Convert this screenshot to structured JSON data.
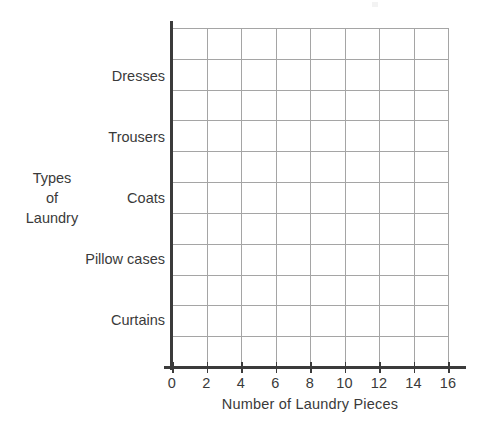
{
  "chart_data": {
    "type": "bar",
    "orientation": "horizontal",
    "title": "",
    "subtitle": "",
    "xlabel": "Number of Laundry Pieces",
    "ylabel": "Types of Laundry",
    "ylabel_lines": [
      "Types",
      "of",
      "Laundry"
    ],
    "categories": [
      "Curtains",
      "Pillow cases",
      "Coats",
      "Trousers",
      "Dresses"
    ],
    "values": [
      null,
      null,
      null,
      null,
      null
    ],
    "series": [
      {
        "name": "Number of Laundry Pieces",
        "values": [
          null,
          null,
          null,
          null,
          null
        ]
      }
    ],
    "xlim": [
      0,
      16
    ],
    "xticks": [
      0,
      2,
      4,
      6,
      8,
      10,
      12,
      14,
      16
    ],
    "xtick_labels": [
      "0",
      "2",
      "4",
      "6",
      "8",
      "10",
      "12",
      "14",
      "16"
    ],
    "x_major_step": 2,
    "grid": true,
    "grid_columns": 8,
    "grid_rows": 11,
    "legend": null,
    "legend_position": "none",
    "annotations": [],
    "note": "Blank worksheet grid: axes and gridlines drawn, no bars plotted yet"
  },
  "axis": {
    "x_title": "Number of Laundry Pieces",
    "y_title_lines": [
      "Types",
      "of",
      "Laundry"
    ],
    "x_tick_labels": [
      "0",
      "2",
      "4",
      "6",
      "8",
      "10",
      "12",
      "14",
      "16"
    ],
    "category_labels": [
      "Dresses",
      "Trousers",
      "Coats",
      "Pillow cases",
      "Curtains"
    ]
  },
  "colors": {
    "background": "#ffffff",
    "axis_line": "#3b3b3b",
    "grid_line": "#a5a5a5",
    "text": "#3a3a3a"
  }
}
